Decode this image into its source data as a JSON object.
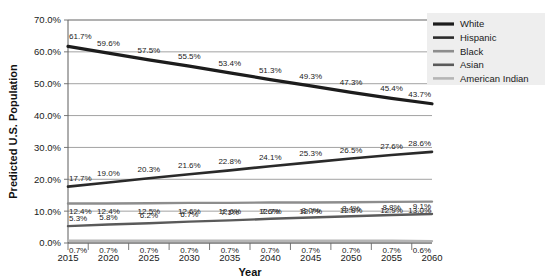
{
  "chart_data": {
    "type": "line",
    "title": "",
    "xlabel": "Year",
    "ylabel": "Predicted U.S. Population",
    "categories": [
      "2015",
      "2020",
      "2025",
      "2030",
      "2035",
      "2040",
      "2045",
      "2050",
      "2055",
      "2060"
    ],
    "x": [
      2015,
      2020,
      2025,
      2030,
      2035,
      2040,
      2045,
      2050,
      2055,
      2060
    ],
    "ylim": [
      0,
      70
    ],
    "xlim": [
      2015,
      2060
    ],
    "y_tick_labels": [
      "0.0%",
      "10.0%",
      "20.0%",
      "30.0%",
      "40.0%",
      "50.0%",
      "60.0%",
      "70.0%"
    ],
    "y_ticks": [
      0,
      10,
      20,
      30,
      40,
      50,
      60,
      70
    ],
    "grid": true,
    "grid_axis": "y",
    "legend_position": "top-right",
    "legend_background": "#eeeeee",
    "series": [
      {
        "name": "White",
        "color": "#1c1c1c",
        "width": 3.2,
        "values": [
          61.7,
          59.6,
          57.5,
          55.5,
          53.4,
          51.3,
          49.3,
          47.3,
          45.4,
          43.7
        ],
        "labels": [
          "61.7%",
          "59.6%",
          "57.5%",
          "55.5%",
          "53.4%",
          "51.3%",
          "49.3%",
          "47.3%",
          "45.4%",
          "43.7%"
        ]
      },
      {
        "name": "Hispanic",
        "color": "#2a2a2a",
        "width": 2.6,
        "values": [
          17.7,
          19.0,
          20.3,
          21.6,
          22.8,
          24.1,
          25.3,
          26.5,
          27.6,
          28.6
        ],
        "labels": [
          "17.7%",
          "19.0%",
          "20.3%",
          "21.6%",
          "22.8%",
          "24.1%",
          "25.3%",
          "26.5%",
          "27.6%",
          "28.6%"
        ]
      },
      {
        "name": "Black",
        "color": "#8d8d8d",
        "width": 2.4,
        "values": [
          12.4,
          12.4,
          12.5,
          12.6,
          12.6,
          12.7,
          12.7,
          12.8,
          12.9,
          13.0
        ],
        "labels": [
          "12.4%",
          "12.4%",
          "12.5%",
          "12.6%",
          "12.6%",
          "12.7%",
          "12.7%",
          "12.8%",
          "12.9%",
          "13.0%"
        ]
      },
      {
        "name": "Asian",
        "color": "#5a5a5a",
        "width": 2.4,
        "values": [
          5.3,
          5.8,
          6.2,
          6.7,
          7.1,
          7.6,
          8.0,
          8.4,
          8.8,
          9.1
        ],
        "labels": [
          "5.3%",
          "5.8%",
          "6.2%",
          "6.7%",
          "7.1%",
          "7.6%",
          "8.0%",
          "8.4%",
          "8.8%",
          "9.1%"
        ]
      },
      {
        "name": "American Indian",
        "color": "#b5b5b5",
        "width": 2.4,
        "values": [
          0.7,
          0.7,
          0.7,
          0.7,
          0.7,
          0.7,
          0.7,
          0.7,
          0.7,
          0.6
        ],
        "labels": [
          "0.7%",
          "0.7%",
          "0.7%",
          "0.7%",
          "0.7%",
          "0.7%",
          "0.7%",
          "0.7%",
          "0.7%",
          "0.6%"
        ]
      }
    ]
  }
}
